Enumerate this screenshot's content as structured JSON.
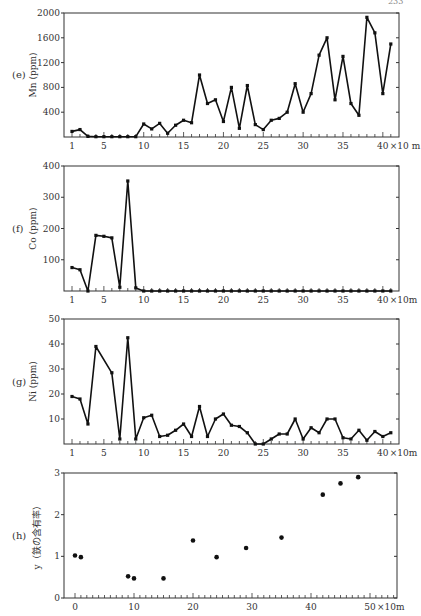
{
  "page_number": "233",
  "chart_data": [
    {
      "panel": "(e)",
      "type": "line",
      "ylabel": "Mn (ppm)",
      "xlabel_suffix": "×10 m",
      "x_tick_labels": [
        "1",
        "5",
        "10",
        "15",
        "20",
        "25",
        "30",
        "35",
        "40"
      ],
      "y_tick_labels": [
        "400",
        "800",
        "1200",
        "1600",
        "2000"
      ],
      "ylim": [
        0,
        2000
      ],
      "xlim": [
        0,
        42
      ],
      "grid": false,
      "x": [
        1,
        2,
        3,
        4,
        5,
        6,
        7,
        8,
        9,
        10,
        11,
        12,
        13,
        14,
        15,
        16,
        17,
        18,
        19,
        20,
        21,
        22,
        23,
        24,
        25,
        26,
        27,
        28,
        29,
        30,
        31,
        32,
        33,
        34,
        35,
        36,
        37,
        38,
        39,
        40,
        41
      ],
      "values": [
        90,
        120,
        10,
        5,
        5,
        5,
        5,
        5,
        5,
        210,
        130,
        220,
        60,
        190,
        270,
        230,
        1000,
        540,
        600,
        250,
        800,
        140,
        830,
        200,
        120,
        270,
        300,
        400,
        860,
        400,
        700,
        1320,
        1600,
        600,
        1300,
        540,
        350,
        1930,
        1680,
        700,
        1500
      ]
    },
    {
      "panel": "(f)",
      "type": "line",
      "ylabel": "Co (ppm)",
      "xlabel_suffix": "×10m",
      "x_tick_labels": [
        "1",
        "5",
        "10",
        "15",
        "20",
        "25",
        "30",
        "35",
        "40"
      ],
      "y_tick_labels": [
        "100",
        "200",
        "300",
        "400"
      ],
      "ylim": [
        0,
        400
      ],
      "xlim": [
        0,
        42
      ],
      "grid": false,
      "x": [
        1,
        2,
        3,
        4,
        5,
        6,
        7,
        8,
        9,
        10,
        11,
        12,
        13,
        14,
        15,
        16,
        17,
        18,
        19,
        20,
        21,
        22,
        23,
        24,
        25,
        26,
        27,
        28,
        29,
        30,
        31,
        32,
        33,
        34,
        35,
        36,
        37,
        38,
        39,
        40,
        41
      ],
      "values": [
        75,
        68,
        0,
        178,
        175,
        170,
        12,
        352,
        10,
        0,
        0,
        0,
        0,
        0,
        0,
        0,
        0,
        0,
        0,
        0,
        0,
        0,
        0,
        0,
        0,
        0,
        0,
        0,
        0,
        0,
        0,
        0,
        0,
        0,
        0,
        0,
        0,
        0,
        0,
        0,
        0
      ]
    },
    {
      "panel": "(g)",
      "type": "line",
      "ylabel": "Ni (ppm)",
      "xlabel_suffix": "×10m",
      "x_tick_labels": [
        "1",
        "5",
        "10",
        "15",
        "20",
        "25",
        "30",
        "35",
        "40"
      ],
      "y_tick_labels": [
        "10",
        "20",
        "30",
        "40",
        "50"
      ],
      "ylim": [
        0,
        50
      ],
      "xlim": [
        0,
        42
      ],
      "grid": false,
      "x": [
        1,
        2,
        3,
        4,
        6,
        7,
        8,
        9,
        10,
        11,
        12,
        13,
        14,
        15,
        16,
        17,
        18,
        19,
        20,
        21,
        22,
        23,
        24,
        25,
        26,
        27,
        28,
        29,
        30,
        31,
        32,
        33,
        34,
        35,
        36,
        37,
        38,
        39,
        40,
        41
      ],
      "values": [
        19,
        18,
        8,
        39,
        28.5,
        2,
        42.5,
        2,
        10.5,
        11.5,
        3,
        3.5,
        5.5,
        8,
        3,
        15,
        3,
        10,
        12,
        7.5,
        7,
        4.5,
        0,
        0,
        2,
        4,
        4,
        10,
        2,
        6.5,
        4.5,
        10,
        10,
        2.5,
        2,
        5.5,
        1.5,
        5,
        3,
        4.5
      ]
    },
    {
      "panel": "(h)",
      "type": "scatter",
      "ylabel": "y（鉄の含有率）",
      "xlabel_suffix": "×10m",
      "x_tick_labels": [
        "0",
        "10",
        "20",
        "30",
        "40",
        "50"
      ],
      "y_tick_labels": [
        "0",
        "1",
        "2",
        "3"
      ],
      "ylim": [
        0,
        3
      ],
      "xlim": [
        -2,
        54
      ],
      "grid": false,
      "x": [
        0,
        1,
        9,
        10,
        15,
        20,
        24,
        29,
        35,
        42,
        45,
        48
      ],
      "values": [
        1.02,
        0.98,
        0.52,
        0.47,
        0.47,
        1.38,
        0.98,
        1.2,
        1.45,
        2.48,
        2.75,
        2.9
      ]
    }
  ],
  "colors": {
    "line": "#111111",
    "axis": "#333333",
    "text": "#333333"
  }
}
